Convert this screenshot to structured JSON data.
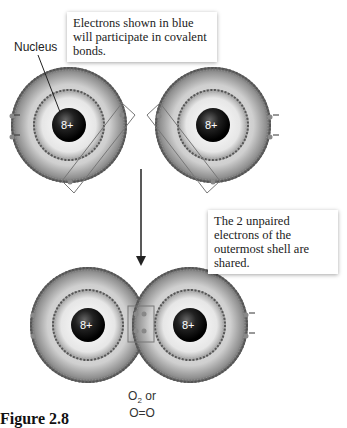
{
  "callouts": {
    "top": "Electrons shown in blue will participate in covalent bonds.",
    "right": "The 2 unpaired electrons of the outermost shell are shared."
  },
  "labels": {
    "nucleus": "Nucleus",
    "nucleus_charge": "8+"
  },
  "formula": {
    "line1_prefix": "O",
    "line1_sub": "2",
    "line1_suffix": " or",
    "line2": "O=O"
  },
  "figure_caption": "Figure 2.8",
  "atoms": [
    {
      "name": "oxygen-atom-left-top",
      "cx": 69,
      "cy": 125,
      "charge": "8+"
    },
    {
      "name": "oxygen-atom-right-top",
      "cx": 213,
      "cy": 125,
      "charge": "8+"
    },
    {
      "name": "oxygen-atom-left-bottom",
      "cx": 88,
      "cy": 325,
      "charge": "8+"
    },
    {
      "name": "oxygen-atom-right-bottom",
      "cx": 190,
      "cy": 325,
      "charge": "8+"
    }
  ]
}
